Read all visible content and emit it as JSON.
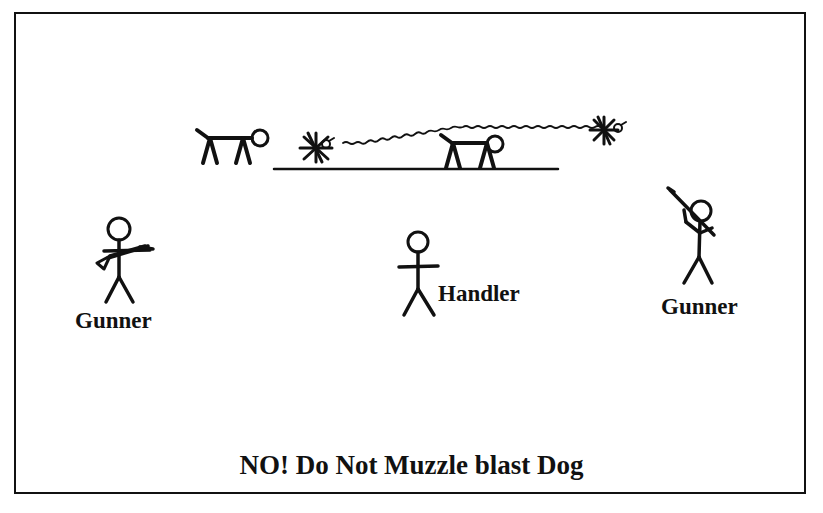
{
  "diagram": {
    "title": "NO! Do Not Muzzle blast Dog",
    "labels": {
      "gunner_left": "Gunner",
      "handler": "Handler",
      "gunner_right": "Gunner"
    },
    "elements": [
      {
        "id": "dog-1",
        "type": "dog-figure",
        "description": "dog standing, left of ground line"
      },
      {
        "id": "bird-launch",
        "type": "bird-burst",
        "description": "bird flushing at start of ground line"
      },
      {
        "id": "flight-path",
        "type": "wavy-line",
        "description": "bird flight path arcing to the right"
      },
      {
        "id": "dog-2",
        "type": "dog-figure",
        "description": "dog standing on ground line"
      },
      {
        "id": "bird-end",
        "type": "bird-burst",
        "description": "bird at end of flight path"
      },
      {
        "id": "ground-line",
        "type": "line"
      },
      {
        "id": "gunner-left",
        "type": "stick-figure",
        "pose": "rifle held horizontally"
      },
      {
        "id": "handler",
        "type": "stick-figure",
        "pose": "arms out"
      },
      {
        "id": "gunner-right",
        "type": "stick-figure",
        "pose": "rifle raised upward"
      }
    ],
    "colors": {
      "ink": "#111111",
      "background": "#ffffff"
    }
  }
}
